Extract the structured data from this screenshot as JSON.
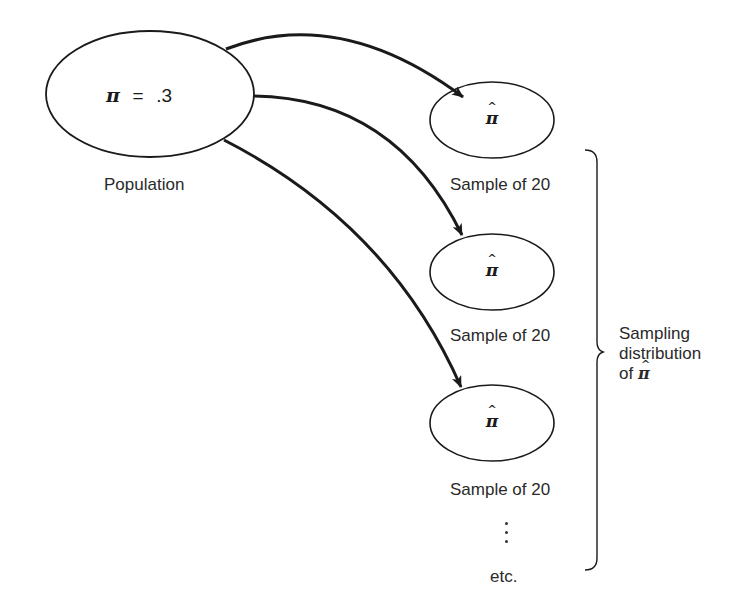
{
  "population": {
    "parameter_symbol": "π",
    "parameter_equals": "=",
    "parameter_value": ".3",
    "label": "Population"
  },
  "samples": [
    {
      "statistic_symbol": "π",
      "hat": "^",
      "label": "Sample of 20"
    },
    {
      "statistic_symbol": "π",
      "hat": "^",
      "label": "Sample of 20"
    },
    {
      "statistic_symbol": "π",
      "hat": "^",
      "label": "Sample of 20"
    }
  ],
  "continuation": {
    "ellipsis": "⋮",
    "label": "etc."
  },
  "brace_annotation": {
    "line1": "Sampling",
    "line2": "distribution",
    "line3_prefix": "of",
    "line3_symbol": "π",
    "line3_hat": "^"
  },
  "colors": {
    "stroke": "#1a1a1a",
    "background": "#ffffff",
    "text": "#2a2a2a"
  }
}
